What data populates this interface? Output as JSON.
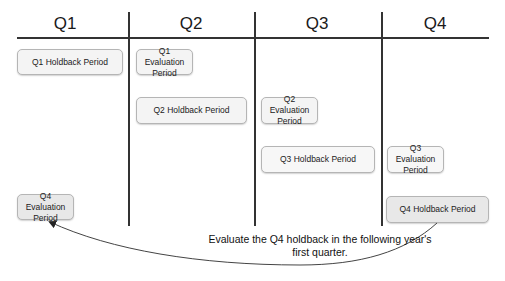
{
  "diagram": {
    "quarters": [
      {
        "label": "Q1"
      },
      {
        "label": "Q2"
      },
      {
        "label": "Q3"
      },
      {
        "label": "Q4"
      }
    ],
    "boxes": [
      {
        "id": "q1-holdback",
        "label": "Q1 Holdback Period",
        "column": "Q1"
      },
      {
        "id": "q1-evaluation",
        "label": "Q1 Evaluation Period",
        "column": "Q2"
      },
      {
        "id": "q2-holdback",
        "label": "Q2 Holdback Period",
        "column": "Q2"
      },
      {
        "id": "q2-evaluation",
        "label": "Q2 Evaluation Period",
        "column": "Q3"
      },
      {
        "id": "q3-holdback",
        "label": "Q3 Holdback Period",
        "column": "Q3"
      },
      {
        "id": "q3-evaluation",
        "label": "Q3 Evaluation Period",
        "column": "Q4"
      },
      {
        "id": "q4-holdback",
        "label": "Q4 Holdback Period",
        "column": "Q4"
      },
      {
        "id": "q4-evaluation",
        "label": "Q4 Evaluation Period",
        "column": "Q1"
      }
    ],
    "arrow": {
      "from": "q4-holdback",
      "to": "q4-evaluation",
      "annotation": "Evaluate the Q4 holdback in the following year's first quarter."
    },
    "colors": {
      "line": "#333333",
      "box_fill": "#f4f4f4",
      "box_fill_q4": "#e8e8e8",
      "box_border": "#b5b5b5"
    }
  }
}
